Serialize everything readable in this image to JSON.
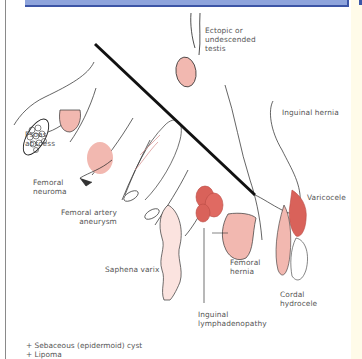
{
  "figure": {
    "title_bar_color": "#8ea4dc",
    "title_bar_border": "#3c55a6",
    "labels": {
      "ectopic": "Ectopic or\nundescended\ntestis",
      "inguinal_hernia": "Inguinal hernia",
      "psoas": "Psoas\nabscess",
      "femoral_neuroma": "Femoral\nneuroma",
      "femoral_artery": "Femoral artery\naneurysm",
      "varicocele": "Varicocele",
      "saphena_varix": "Saphena varix",
      "femoral_hernia": "Femoral\nhernia",
      "cordal_hydrocele": "Cordal\nhydrocele",
      "inguinal_lymph": "Inguinal\nlymphadenopathy"
    },
    "footnotes": [
      "+ Sebaceous (epidermoid) cyst",
      "+ Lipoma"
    ],
    "colors": {
      "lesion_pink": "#f2b8b0",
      "lesion_red": "#d9625a",
      "varix_pale": "#fbe3df",
      "line": "#222222"
    }
  }
}
